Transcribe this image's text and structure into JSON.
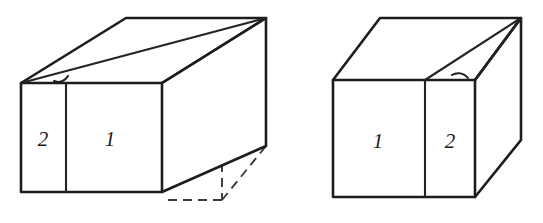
{
  "diagram": {
    "stroke_color": "#1d1d1d",
    "hidden_stroke_color": "#3a3a3a",
    "background_color": "#ffffff",
    "figures": [
      {
        "id": "left-figure",
        "name": "left-block",
        "label_order": "2 then 1",
        "has_hidden_edges": true,
        "panels": [
          {
            "name": "panel-2",
            "label": "2"
          },
          {
            "name": "panel-1",
            "label": "1"
          }
        ],
        "angle_arc": {
          "name": "angle-arc-left",
          "position": "top-front-left-corner"
        }
      },
      {
        "id": "right-figure",
        "name": "right-block",
        "label_order": "1 then 2",
        "has_hidden_edges": false,
        "panels": [
          {
            "name": "panel-1",
            "label": "1"
          },
          {
            "name": "panel-2",
            "label": "2"
          }
        ],
        "angle_arc": {
          "name": "angle-arc-right",
          "position": "top-front-right-corner"
        }
      }
    ]
  }
}
